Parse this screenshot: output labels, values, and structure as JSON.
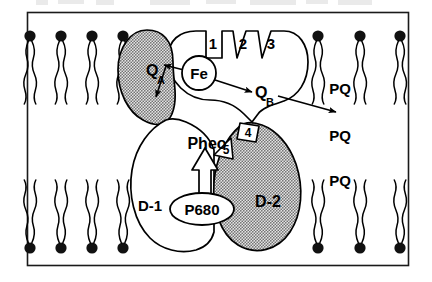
{
  "figure": {
    "frame": {
      "border_color": "#1a1a1a",
      "background": "#ffffff"
    },
    "colors": {
      "ink": "#000000",
      "stipple_gray": "#9a9a9a",
      "stipple_light": "#c9c9c9",
      "protein_fill": "#ffffff",
      "lipid_head": "#111111"
    }
  },
  "membrane": {
    "label": "lipid bilayer",
    "upper_leaflet": {
      "head_y": 36,
      "tail_end_y": 122,
      "head_positions_x": [
        30,
        61,
        92,
        123,
        318,
        360,
        400
      ]
    },
    "lower_leaflet": {
      "head_y": 248,
      "tail_end_y": 162,
      "head_positions_x": [
        30,
        61,
        92,
        123,
        318,
        360,
        400
      ]
    }
  },
  "proteins": {
    "d1": {
      "label": "D-1",
      "x": 150,
      "y": 205,
      "fill": "white"
    },
    "d2": {
      "label": "D-2",
      "x": 268,
      "y": 201,
      "fill": "stippled"
    },
    "qa_lobe": {
      "label": "Q-A binding lobe",
      "fill": "stippled"
    },
    "cp_lobe": {
      "label": "antenna lobe",
      "fill": "white"
    }
  },
  "cofactors": [
    {
      "name": "Q_A",
      "base": "Q",
      "sub": "A",
      "x": 155,
      "y": 70,
      "shape": "text"
    },
    {
      "name": "Fe",
      "base": "Fe",
      "sub": "",
      "x": 199,
      "y": 73,
      "shape": "circle"
    },
    {
      "name": "Q_B",
      "base": "Q",
      "sub": "B",
      "x": 264,
      "y": 92,
      "shape": "text"
    },
    {
      "name": "Pheo",
      "base": "Pheo",
      "sub": "",
      "x": 207,
      "y": 143,
      "shape": "text"
    },
    {
      "name": "P680",
      "base": "P680",
      "sub": "",
      "x": 202,
      "y": 209,
      "shape": "ellipse"
    }
  ],
  "helix_tags": [
    {
      "label": "1",
      "x": 213,
      "y": 42
    },
    {
      "label": "2",
      "x": 243,
      "y": 43
    },
    {
      "label": "3",
      "x": 270,
      "y": 43
    }
  ],
  "site_tags": [
    {
      "label": "4",
      "x": 249,
      "y": 131,
      "shape": "square"
    },
    {
      "label": "5",
      "x": 223,
      "y": 148,
      "shape": "pentagon"
    }
  ],
  "plastoquinone_labels": [
    {
      "label": "PQ",
      "x": 340,
      "y": 88
    },
    {
      "label": "PQ",
      "x": 340,
      "y": 135
    },
    {
      "label": "PQ",
      "x": 340,
      "y": 180
    }
  ],
  "arrows": [
    {
      "name": "fe-to-qa",
      "from": "Fe",
      "to": "Q_A",
      "style": "solid-thin"
    },
    {
      "name": "qa-downward",
      "from": "Q_A",
      "to": "lower-lobe",
      "style": "solid-thin"
    },
    {
      "name": "fe-to-qb",
      "from": "Fe",
      "to": "Q_B",
      "style": "solid-thin"
    },
    {
      "name": "qb-to-pq",
      "from": "Q_B",
      "to": "PQ",
      "style": "solid-thin"
    },
    {
      "name": "p680-to-pheo",
      "from": "P680",
      "to": "Pheo",
      "style": "hollow-outline"
    }
  ]
}
